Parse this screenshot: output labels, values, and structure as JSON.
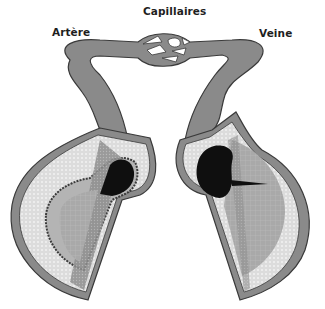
{
  "labels": {
    "capillaries": "Capillaires",
    "artery": "Artère",
    "vein": "Veine"
  },
  "colors": {
    "vessel_outer": "#8a8a8a",
    "vessel_outline": "#3a3a3a",
    "adventitia": "#c8c8c8",
    "media": "#e2e2e2",
    "intima": "#b4b4b4",
    "lumen": "#0f0f0f",
    "cut_face": "#a8a8a8"
  }
}
